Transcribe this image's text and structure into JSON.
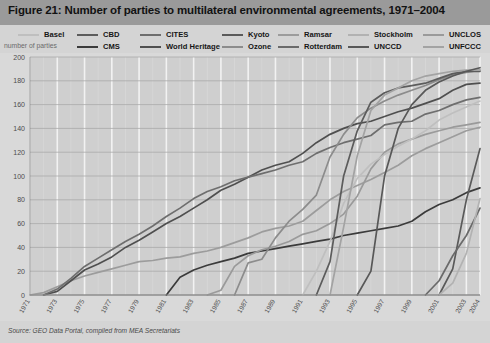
{
  "figure": {
    "title": "Figure 21: Number of parties to multilateral environmental agreements, 1971–2004",
    "source_note": "Source: GEO Data Portal, compiled from MEA Secretariats",
    "axis_y_label": "number of parties",
    "title_bar_color": "#9a9a9a",
    "panel_color": "#d9d9d9",
    "plot_bg_color": "#cfcfcf",
    "grid_color": "#f2f2f2",
    "gridline_major_color": "#a9a9a9"
  },
  "legend": {
    "position": "top",
    "columns": 7,
    "rows": 2,
    "entries": [
      {
        "label": "Basel",
        "color": "#bfbfbf",
        "col": 0,
        "row": 0
      },
      {
        "label": "CMS",
        "color": "#3b3b3b",
        "col": 1,
        "row": 1
      },
      {
        "label": "CBD",
        "color": "#5c5c5c",
        "col": 1,
        "row": 0
      },
      {
        "label": "World Heritage",
        "color": "#4f4f4f",
        "col": 2,
        "row": 1
      },
      {
        "label": "CITES",
        "color": "#6e6e6e",
        "col": 2,
        "row": 0
      },
      {
        "label": "Ozone",
        "color": "#8c8c8c",
        "col": 3,
        "row": 1
      },
      {
        "label": "Kyoto",
        "color": "#5a5a5a",
        "col": 3,
        "row": 0
      },
      {
        "label": "Rotterdam",
        "color": "#6a6a6a",
        "col": 4,
        "row": 1
      },
      {
        "label": "Ramsar",
        "color": "#9c9c9c",
        "col": 4,
        "row": 0
      },
      {
        "label": "UNCCD",
        "color": "#585858",
        "col": 5,
        "row": 1
      },
      {
        "label": "Stockholm",
        "color": "#b2b2b2",
        "col": 5,
        "row": 0
      },
      {
        "label": "UNFCCC",
        "color": "#a3a3a3",
        "col": 6,
        "row": 1
      },
      {
        "label": "UNCLOS",
        "color": "#9a9a9a",
        "col": 6,
        "row": 0
      }
    ]
  },
  "chart_data": {
    "type": "line",
    "title": "Figure 21: Number of parties to multilateral environmental agreements, 1971–2004",
    "xlabel": "",
    "ylabel": "number of parties",
    "xlim": [
      1971,
      2004
    ],
    "ylim": [
      0,
      200
    ],
    "yticks": [
      0,
      20,
      40,
      60,
      80,
      100,
      120,
      140,
      160,
      180,
      200
    ],
    "xticks": [
      1971,
      1973,
      1975,
      1977,
      1979,
      1981,
      1983,
      1985,
      1987,
      1989,
      1991,
      1993,
      1995,
      1997,
      1999,
      2001,
      2003,
      2004
    ],
    "xtick_labels": [
      "1971",
      "1973",
      "1975",
      "1977",
      "1979",
      "1981",
      "1983",
      "1985",
      "1987",
      "1989",
      "1991",
      "1993",
      "1995",
      "1997",
      "1999",
      "2001",
      "2003",
      "2004"
    ],
    "xtick_rotation": -60,
    "grid": true,
    "legend_position": "top",
    "x": [
      1971,
      1972,
      1973,
      1974,
      1975,
      1976,
      1977,
      1978,
      1979,
      1980,
      1981,
      1982,
      1983,
      1984,
      1985,
      1986,
      1987,
      1988,
      1989,
      1990,
      1991,
      1992,
      1993,
      1994,
      1995,
      1996,
      1997,
      1998,
      1999,
      2000,
      2001,
      2002,
      2003,
      2004
    ],
    "series": [
      {
        "name": "Ramsar",
        "color": "#9c9c9c",
        "values": [
          0,
          2,
          7,
          12,
          16,
          19,
          22,
          25,
          28,
          29,
          31,
          32,
          35,
          37,
          40,
          44,
          48,
          53,
          56,
          58,
          62,
          71,
          80,
          87,
          92,
          97,
          103,
          109,
          117,
          123,
          128,
          133,
          138,
          141
        ]
      },
      {
        "name": "World Heritage",
        "color": "#4f4f4f",
        "values": [
          0,
          0,
          3,
          12,
          21,
          26,
          32,
          40,
          46,
          53,
          60,
          66,
          73,
          80,
          88,
          93,
          99,
          105,
          109,
          112,
          119,
          128,
          135,
          140,
          144,
          146,
          150,
          154,
          157,
          161,
          165,
          172,
          177,
          178
        ]
      },
      {
        "name": "CITES",
        "color": "#6e6e6e",
        "values": [
          0,
          0,
          5,
          14,
          24,
          31,
          38,
          45,
          51,
          58,
          66,
          73,
          81,
          87,
          91,
          96,
          99,
          102,
          105,
          109,
          112,
          119,
          124,
          128,
          131,
          134,
          143,
          145,
          146,
          152,
          155,
          160,
          164,
          166
        ]
      },
      {
        "name": "CMS",
        "color": "#3b3b3b",
        "values": [
          0,
          0,
          0,
          0,
          0,
          0,
          0,
          0,
          0,
          0,
          0,
          15,
          21,
          25,
          28,
          31,
          35,
          37,
          39,
          41,
          43,
          45,
          47,
          50,
          52,
          54,
          56,
          58,
          62,
          70,
          76,
          80,
          86,
          90
        ]
      },
      {
        "name": "UNCLOS",
        "color": "#9a9a9a",
        "values": [
          0,
          0,
          0,
          0,
          0,
          0,
          0,
          0,
          0,
          0,
          0,
          0,
          0,
          0,
          4,
          24,
          33,
          38,
          41,
          45,
          51,
          54,
          60,
          68,
          83,
          106,
          120,
          127,
          131,
          135,
          138,
          141,
          143,
          145
        ]
      },
      {
        "name": "Basel",
        "color": "#bfbfbf",
        "values": [
          0,
          0,
          0,
          0,
          0,
          0,
          0,
          0,
          0,
          0,
          0,
          0,
          0,
          0,
          0,
          0,
          0,
          0,
          0,
          0,
          0,
          20,
          45,
          77,
          98,
          110,
          118,
          125,
          131,
          138,
          147,
          153,
          158,
          163
        ]
      },
      {
        "name": "Ozone",
        "color": "#8c8c8c",
        "values": [
          0,
          0,
          0,
          0,
          0,
          0,
          0,
          0,
          0,
          0,
          0,
          0,
          0,
          0,
          0,
          0,
          27,
          30,
          48,
          62,
          72,
          84,
          116,
          135,
          149,
          157,
          163,
          168,
          172,
          176,
          181,
          185,
          187,
          189
        ]
      },
      {
        "name": "CBD",
        "color": "#5c5c5c",
        "values": [
          0,
          0,
          0,
          0,
          0,
          0,
          0,
          0,
          0,
          0,
          0,
          0,
          0,
          0,
          0,
          0,
          0,
          0,
          0,
          0,
          0,
          0,
          28,
          100,
          138,
          162,
          170,
          174,
          176,
          178,
          182,
          186,
          188,
          188
        ]
      },
      {
        "name": "UNFCCC",
        "color": "#a3a3a3",
        "values": [
          0,
          0,
          0,
          0,
          0,
          0,
          0,
          0,
          0,
          0,
          0,
          0,
          0,
          0,
          0,
          0,
          0,
          0,
          0,
          0,
          0,
          0,
          0,
          57,
          117,
          155,
          168,
          174,
          180,
          184,
          186,
          188,
          189,
          189
        ]
      },
      {
        "name": "UNCCD",
        "color": "#585858",
        "values": [
          0,
          0,
          0,
          0,
          0,
          0,
          0,
          0,
          0,
          0,
          0,
          0,
          0,
          0,
          0,
          0,
          0,
          0,
          0,
          0,
          0,
          0,
          0,
          0,
          0,
          20,
          100,
          140,
          160,
          172,
          179,
          184,
          188,
          191
        ]
      },
      {
        "name": "Kyoto",
        "color": "#5a5a5a",
        "values": [
          0,
          0,
          0,
          0,
          0,
          0,
          0,
          0,
          0,
          0,
          0,
          0,
          0,
          0,
          0,
          0,
          0,
          0,
          0,
          0,
          0,
          0,
          0,
          0,
          0,
          0,
          0,
          0,
          0,
          0,
          0,
          22,
          80,
          123
        ]
      },
      {
        "name": "Rotterdam",
        "color": "#6a6a6a",
        "values": [
          0,
          0,
          0,
          0,
          0,
          0,
          0,
          0,
          0,
          0,
          0,
          0,
          0,
          0,
          0,
          0,
          0,
          0,
          0,
          0,
          0,
          0,
          0,
          0,
          0,
          0,
          0,
          0,
          0,
          0,
          12,
          33,
          50,
          73
        ]
      },
      {
        "name": "Stockholm",
        "color": "#b2b2b2",
        "values": [
          0,
          0,
          0,
          0,
          0,
          0,
          0,
          0,
          0,
          0,
          0,
          0,
          0,
          0,
          0,
          0,
          0,
          0,
          0,
          0,
          0,
          0,
          0,
          0,
          0,
          0,
          0,
          0,
          0,
          0,
          0,
          10,
          35,
          81
        ]
      }
    ]
  }
}
